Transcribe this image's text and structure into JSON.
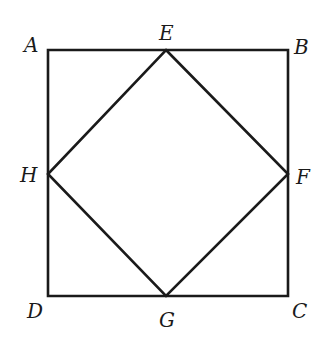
{
  "diagram": {
    "outer_square": {
      "vertices": [
        "A",
        "B",
        "C",
        "D"
      ]
    },
    "inner_square": {
      "vertices": [
        "E",
        "F",
        "G",
        "H"
      ]
    },
    "labels": {
      "A": "A",
      "B": "B",
      "C": "C",
      "D": "D",
      "E": "E",
      "F": "F",
      "G": "G",
      "H": "H"
    },
    "stroke_color": "#1a1a1a",
    "background": "#ffffff"
  }
}
